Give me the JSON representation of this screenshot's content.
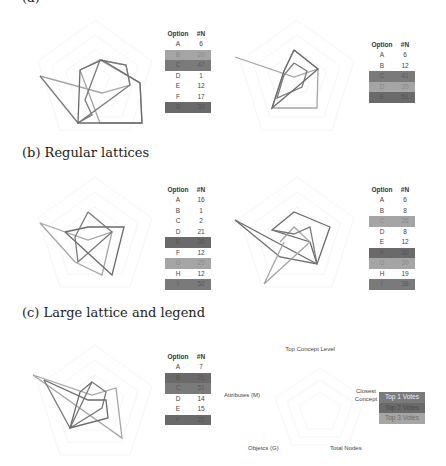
{
  "captions": {
    "a": "(a)",
    "b": "(b) Regular lattices",
    "c": "(c) Large lattice and legend"
  },
  "table_header": {
    "option": "Option",
    "n": "#N"
  },
  "legend": {
    "axes": {
      "top": "Top Concept Level",
      "right": "Closest Concept",
      "bottom_right": "Total Nodes",
      "bottom_left": "Objetcs (G)",
      "left": "Attributes (M)"
    },
    "items": [
      {
        "label": "Top 1 Votes",
        "color": "#7a7a7a"
      },
      {
        "label": "Top 2 Votes",
        "color": "#6a6a6a"
      },
      {
        "label": "Top 3 Votes",
        "color": "#a5a5a5"
      }
    ]
  },
  "chart_data": [
    {
      "type": "table",
      "section": "(a)",
      "panel": 1,
      "columns": [
        "Option",
        "#N"
      ],
      "rows": [
        {
          "option": "A",
          "n": "6",
          "hl": ""
        },
        {
          "option": "B",
          "n": "20",
          "hl": "hl3"
        },
        {
          "option": "C",
          "n": "47",
          "hl": "hl1"
        },
        {
          "option": "D",
          "n": "1",
          "hl": ""
        },
        {
          "option": "E",
          "n": "12",
          "hl": ""
        },
        {
          "option": "F",
          "n": "17",
          "hl": ""
        },
        {
          "option": "G",
          "n": "39",
          "hl": "hl2"
        }
      ]
    },
    {
      "type": "table",
      "section": "(a)",
      "panel": 2,
      "columns": [
        "Option",
        "#N"
      ],
      "rows": [
        {
          "option": "A",
          "n": "6",
          "hl": ""
        },
        {
          "option": "B",
          "n": "12",
          "hl": ""
        },
        {
          "option": "C",
          "n": "41",
          "hl": "hl1"
        },
        {
          "option": "D",
          "n": "35",
          "hl": "hl3"
        },
        {
          "option": "E",
          "n": "51",
          "hl": "hl2"
        }
      ]
    },
    {
      "type": "table",
      "section": "(b) Regular lattices",
      "panel": 1,
      "columns": [
        "Option",
        "#N"
      ],
      "rows": [
        {
          "option": "A",
          "n": "16",
          "hl": ""
        },
        {
          "option": "B",
          "n": "1",
          "hl": ""
        },
        {
          "option": "C",
          "n": "2",
          "hl": ""
        },
        {
          "option": "D",
          "n": "21",
          "hl": ""
        },
        {
          "option": "E",
          "n": "38",
          "hl": "hl2"
        },
        {
          "option": "F",
          "n": "12",
          "hl": ""
        },
        {
          "option": "G",
          "n": "25",
          "hl": "hl3"
        },
        {
          "option": "H",
          "n": "12",
          "hl": ""
        },
        {
          "option": "I",
          "n": "52",
          "hl": "hl1"
        }
      ]
    },
    {
      "type": "table",
      "section": "(b) Regular lattices",
      "panel": 2,
      "columns": [
        "Option",
        "#N"
      ],
      "rows": [
        {
          "option": "A",
          "n": "6",
          "hl": ""
        },
        {
          "option": "B",
          "n": "8",
          "hl": ""
        },
        {
          "option": "C",
          "n": "26",
          "hl": "hl3"
        },
        {
          "option": "D",
          "n": "8",
          "hl": ""
        },
        {
          "option": "E",
          "n": "12",
          "hl": ""
        },
        {
          "option": "F",
          "n": "30",
          "hl": "hl2"
        },
        {
          "option": "G",
          "n": "30",
          "hl": "hl3"
        },
        {
          "option": "H",
          "n": "19",
          "hl": ""
        },
        {
          "option": "I",
          "n": "38",
          "hl": "hl1"
        }
      ]
    },
    {
      "type": "table",
      "section": "(c) Large lattice and legend",
      "panel": 1,
      "columns": [
        "Option",
        "#N"
      ],
      "rows": [
        {
          "option": "A",
          "n": "7",
          "hl": ""
        },
        {
          "option": "B",
          "n": "21",
          "hl": "hl2"
        },
        {
          "option": "C",
          "n": "51",
          "hl": "hl1"
        },
        {
          "option": "D",
          "n": "14",
          "hl": ""
        },
        {
          "option": "E",
          "n": "15",
          "hl": ""
        },
        {
          "option": "F",
          "n": "20",
          "hl": "hl2"
        }
      ]
    },
    {
      "type": "radar",
      "note": "Five-axis radar charts (Top Concept Level, Closest Concept, Total Nodes, Objects (G), Attributes (M)) with overlaid polygons for top-3 voted options; grid = concentric pentagons",
      "axes": [
        "Top Concept Level",
        "Closest Concept",
        "Total Nodes",
        "Objetcs (G)",
        "Attributes (M)"
      ],
      "legend": [
        "Top 1 Votes",
        "Top 2 Votes",
        "Top 3 Votes"
      ]
    }
  ]
}
